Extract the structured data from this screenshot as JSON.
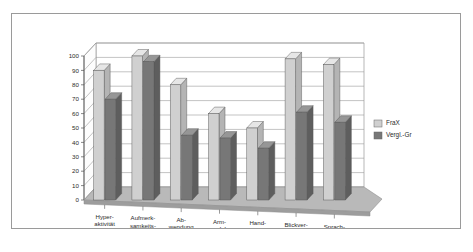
{
  "chart_data": {
    "type": "bar",
    "title": "",
    "subtitle": "",
    "xlabel": "",
    "ylabel": "",
    "ylim": [
      0,
      100
    ],
    "ytick_step": 10,
    "yticks": [
      "0",
      "10",
      "20",
      "30",
      "40",
      "50",
      "60",
      "70",
      "80",
      "90",
      "100"
    ],
    "grid": true,
    "legend_position": "right",
    "style": "3d-column",
    "categories": [
      "Hyper-\naktivität",
      "Aufmerk-\nsamkeits-\nprobleme",
      "Ab-\nwendung",
      "Arm-\nwedeln",
      "Hand-\nbeißen",
      "Blickver-\nmeidung",
      "Sprach-\nauffällig-\nkeit"
    ],
    "category_lines": [
      [
        "Hyper-",
        "aktivität"
      ],
      [
        "Aufmerk-",
        "samkeits-",
        "probleme"
      ],
      [
        "Ab-",
        "wendung"
      ],
      [
        "Arm-",
        "wedeln"
      ],
      [
        "Hand-",
        "beißen"
      ],
      [
        "Blickver-",
        "meidung"
      ],
      [
        "Sprach-",
        "auffällig-",
        "keit"
      ]
    ],
    "series": [
      {
        "name": "FraX",
        "color": "#d0d0d0",
        "values": [
          90,
          100,
          80,
          60,
          50,
          98,
          94
        ]
      },
      {
        "name": "Vergl.-Gr",
        "color": "#777777",
        "values": [
          70,
          96,
          45,
          43,
          36,
          61,
          54
        ]
      }
    ]
  },
  "legend": {
    "entries": [
      {
        "label": "FraX",
        "color": "#d0d0d0"
      },
      {
        "label": "Vergl.-Gr",
        "color": "#777777"
      }
    ]
  },
  "colors": {
    "series_1_face": "#d0d0d0",
    "series_1_side": "#b4b4b4",
    "series_1_top": "#e6e6e6",
    "series_2_face": "#777777",
    "series_2_side": "#5e5e5e",
    "series_2_top": "#969696",
    "floor": "#b9b9b9",
    "floor_side": "#9d9d9d",
    "wall": "#ffffff",
    "gridline": "#9a9a9a",
    "axis": "#555555",
    "frame_border": "#9a9a9a",
    "text": "#2b2b2b"
  }
}
